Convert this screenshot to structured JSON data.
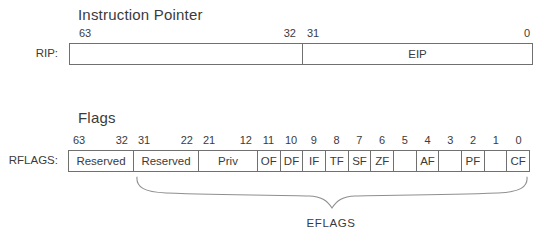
{
  "instruction_pointer": {
    "title": "Instruction Pointer",
    "register_label": "RIP:",
    "fields": [
      {
        "high": "63",
        "low": "32",
        "label": ""
      },
      {
        "high": "31",
        "low": "0",
        "label": "EIP"
      }
    ]
  },
  "flags": {
    "title": "Flags",
    "register_label": "RFLAGS:",
    "range_fields": [
      {
        "high": "63",
        "low": "32",
        "label": "Reserved"
      },
      {
        "high": "31",
        "low": "22",
        "label": "Reserved"
      },
      {
        "high": "21",
        "low": "12",
        "label": "Priv"
      }
    ],
    "bit_fields": [
      {
        "bit": "11",
        "label": "OF"
      },
      {
        "bit": "10",
        "label": "DF"
      },
      {
        "bit": "9",
        "label": "IF"
      },
      {
        "bit": "8",
        "label": "TF"
      },
      {
        "bit": "7",
        "label": "SF"
      },
      {
        "bit": "6",
        "label": "ZF"
      },
      {
        "bit": "5",
        "label": ""
      },
      {
        "bit": "4",
        "label": "AF"
      },
      {
        "bit": "3",
        "label": ""
      },
      {
        "bit": "2",
        "label": "PF"
      },
      {
        "bit": "1",
        "label": ""
      },
      {
        "bit": "0",
        "label": "CF"
      }
    ],
    "brace_label": "EFLAGS"
  },
  "colors": {
    "background": "#ffffff",
    "text": "#3b3b3b",
    "border": "#707070",
    "brace": "#8f8f8f"
  }
}
